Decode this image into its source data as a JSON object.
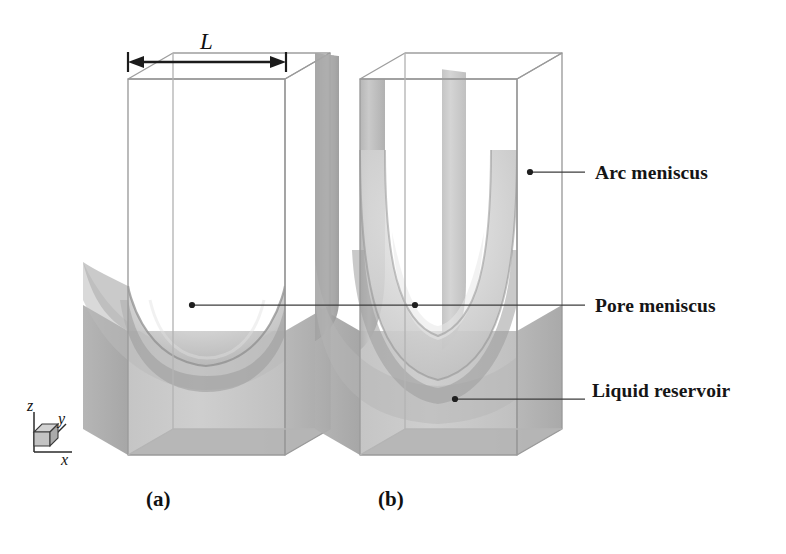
{
  "figure": {
    "kind": "scientific-diagram",
    "background_color": "#ffffff"
  },
  "dimension": {
    "label": "L",
    "icon": "double-headed-arrow-icon",
    "describes": "pore side length across the top front edge of panel (a)"
  },
  "axes": {
    "icon": "axis-triad-icon",
    "z": "z",
    "y": "y",
    "x": "x"
  },
  "panels": [
    {
      "id": "a",
      "caption": "(a)",
      "state": "shallow pore meniscus, no corner arc menisci"
    },
    {
      "id": "b",
      "caption": "(b)",
      "state": "deep U-shaped pore meniscus with arc menisci in the four corners"
    }
  ],
  "callouts": [
    {
      "id": "arc-meniscus",
      "label": "Arc meniscus",
      "points_to_panel": "b",
      "marker": "leader-dot"
    },
    {
      "id": "pore-meniscus",
      "label": "Pore meniscus",
      "points_to_panel": "a and b",
      "marker": "leader-dot"
    },
    {
      "id": "liquid-reservoir",
      "label": "Liquid reservoir",
      "points_to_panel": "b",
      "marker": "leader-dot"
    }
  ],
  "colors": {
    "outline": "#8d8d8d",
    "leader_line": "#3b3b3b",
    "arrow": "#1a1a1a",
    "liquid_light": "#c9c9c9",
    "liquid_mid": "#bcbcbc",
    "liquid_dark": "#a2a2a2",
    "meniscus_rim": "#969696",
    "text": "#111111"
  }
}
